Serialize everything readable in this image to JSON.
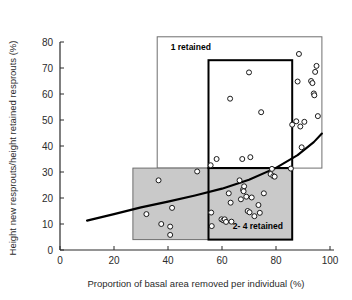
{
  "chart_data": {
    "type": "scatter",
    "title": "",
    "xlabel": "Proportion of basal area removed per individual (%)",
    "ylabel": "Height new resprouts/height retained resprouts  (%)",
    "xlim": [
      0,
      100
    ],
    "ylim": [
      0,
      80
    ],
    "xticks": [
      0,
      20,
      40,
      60,
      80,
      100
    ],
    "yticks": [
      0,
      10,
      20,
      30,
      40,
      50,
      60,
      70,
      80
    ],
    "grid": false,
    "legend": "none",
    "marker": "open-circle",
    "points": [
      {
        "x": 32.0,
        "y": 13.8
      },
      {
        "x": 36.5,
        "y": 26.8
      },
      {
        "x": 37.5,
        "y": 10.0
      },
      {
        "x": 40.8,
        "y": 9.0
      },
      {
        "x": 40.8,
        "y": 5.8
      },
      {
        "x": 41.5,
        "y": 16.2
      },
      {
        "x": 50.8,
        "y": 30.2
      },
      {
        "x": 55.8,
        "y": 32.6
      },
      {
        "x": 56.0,
        "y": 14.4
      },
      {
        "x": 56.2,
        "y": 9.2
      },
      {
        "x": 58.0,
        "y": 35.0
      },
      {
        "x": 59.8,
        "y": 11.8
      },
      {
        "x": 60.5,
        "y": 11.4
      },
      {
        "x": 61.0,
        "y": 11.8
      },
      {
        "x": 61.5,
        "y": 10.8
      },
      {
        "x": 62.5,
        "y": 21.8
      },
      {
        "x": 63.0,
        "y": 58.2
      },
      {
        "x": 63.2,
        "y": 18.2
      },
      {
        "x": 63.5,
        "y": 10.9
      },
      {
        "x": 66.5,
        "y": 26.8
      },
      {
        "x": 67.0,
        "y": 19.5
      },
      {
        "x": 67.5,
        "y": 35.0
      },
      {
        "x": 67.8,
        "y": 23.2
      },
      {
        "x": 68.0,
        "y": 22.6
      },
      {
        "x": 68.2,
        "y": 24.5
      },
      {
        "x": 69.0,
        "y": 20.5
      },
      {
        "x": 69.5,
        "y": 15.0
      },
      {
        "x": 70.0,
        "y": 68.3
      },
      {
        "x": 70.2,
        "y": 14.5
      },
      {
        "x": 70.5,
        "y": 35.7
      },
      {
        "x": 71.0,
        "y": 20.2
      },
      {
        "x": 72.0,
        "y": 13.0
      },
      {
        "x": 73.5,
        "y": 17.3
      },
      {
        "x": 74.0,
        "y": 14.3
      },
      {
        "x": 74.5,
        "y": 53.0
      },
      {
        "x": 75.5,
        "y": 21.8
      },
      {
        "x": 78.0,
        "y": 29.2
      },
      {
        "x": 78.5,
        "y": 31.2
      },
      {
        "x": 79.0,
        "y": 28.4
      },
      {
        "x": 79.5,
        "y": 28.2
      },
      {
        "x": 85.5,
        "y": 31.3
      },
      {
        "x": 86.0,
        "y": 48.2
      },
      {
        "x": 87.5,
        "y": 49.5
      },
      {
        "x": 88.0,
        "y": 64.8
      },
      {
        "x": 88.5,
        "y": 75.4
      },
      {
        "x": 89.0,
        "y": 47.5
      },
      {
        "x": 89.5,
        "y": 39.5
      },
      {
        "x": 90.5,
        "y": 49.3
      },
      {
        "x": 93.0,
        "y": 65.0
      },
      {
        "x": 93.5,
        "y": 64.2
      },
      {
        "x": 94.0,
        "y": 60.2
      },
      {
        "x": 94.2,
        "y": 59.5
      },
      {
        "x": 94.5,
        "y": 68.5
      },
      {
        "x": 95.0,
        "y": 70.8
      },
      {
        "x": 95.5,
        "y": 51.5
      }
    ],
    "trend_line": {
      "name": "fitted exponential trend",
      "x": [
        10,
        20,
        30,
        40,
        50,
        60,
        70,
        80,
        88,
        94,
        97
      ],
      "y": [
        11.3,
        13.8,
        16.4,
        18.6,
        21.0,
        23.6,
        27.0,
        31.6,
        36.5,
        41.5,
        44.8
      ]
    },
    "regions": [
      {
        "label": "1 retained",
        "style": "white-fill-thin-border",
        "x0": 36.0,
        "x1": 97.0,
        "y0": 31.5,
        "y1": 82.0,
        "label_x": 41.0,
        "label_y": 77.0
      },
      {
        "label": "2- 4 retained",
        "style": "gray-fill-thin-border",
        "x0": 27.0,
        "x1": 86.0,
        "y0": 4.0,
        "y1": 31.5,
        "label_x": 0,
        "label_y": 0
      },
      {
        "label": "1 retained",
        "style": "white-fill-bold-border",
        "x0": 55.0,
        "x1": 86.0,
        "y0": 31.5,
        "y1": 73.0,
        "label_x": 0,
        "label_y": 0
      },
      {
        "label": "2- 4 retained",
        "style": "gray-fill-bold-border",
        "x0": 55.0,
        "x1": 86.0,
        "y0": 4.0,
        "y1": 31.5,
        "label_x": 64.0,
        "label_y": 8.0
      }
    ]
  },
  "colors": {
    "background": "#ffffff",
    "axis": "#2b2b2b",
    "marker_stroke": "#1a1a1a",
    "marker_fill": "#ffffff",
    "trend_line": "#000000",
    "gray_box_fill": "#c9c9c9",
    "box_border_thin": "#6e6e6e",
    "box_border_bold": "#000000",
    "text": "#2b2b2b"
  },
  "axes": {
    "x_title": "Proportion of basal area removed per individual (%)",
    "y_title": "Height new resprouts/height retained resprouts  (%)",
    "x_tick_labels": [
      "0",
      "20",
      "40",
      "60",
      "80",
      "100"
    ],
    "y_tick_labels": [
      "0",
      "10",
      "20",
      "30",
      "40",
      "50",
      "60",
      "70",
      "80"
    ]
  },
  "annotations": {
    "box_1_retained": "1 retained",
    "box_2_4_retained": "2- 4 retained"
  }
}
